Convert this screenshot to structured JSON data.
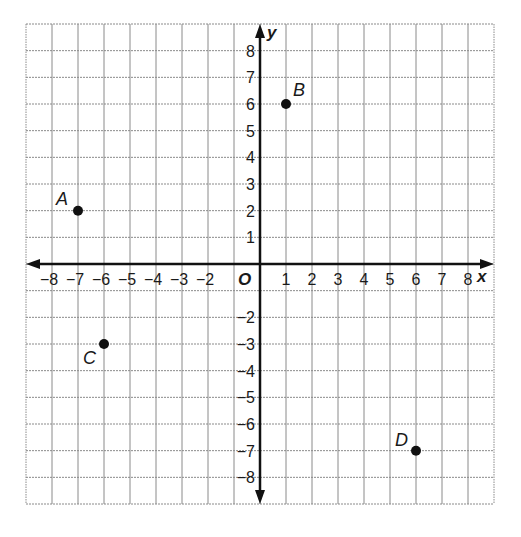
{
  "chart_data": {
    "type": "scatter",
    "title": "",
    "xlabel": "x",
    "ylabel": "y",
    "origin_label": "O",
    "xlim": [
      -9,
      9
    ],
    "ylim": [
      -9,
      9
    ],
    "grid": true,
    "x_ticks": [
      -8,
      -7,
      -6,
      -5,
      -4,
      -3,
      -2,
      1,
      2,
      3,
      4,
      5,
      6,
      7,
      8
    ],
    "x_tick_labels": [
      "−8",
      "−7",
      "−6",
      "−5",
      "−4",
      "−3",
      "−2",
      "1",
      "2",
      "3",
      "4",
      "5",
      "6",
      "7",
      "8"
    ],
    "y_ticks": [
      8,
      7,
      6,
      5,
      4,
      3,
      2,
      1,
      -2,
      -3,
      -4,
      -5,
      -6,
      -7,
      -8
    ],
    "y_tick_labels": [
      "8",
      "7",
      "6",
      "5",
      "4",
      "3",
      "2",
      "1",
      "−2",
      "−3",
      "−4",
      "−5",
      "−6",
      "−7",
      "−8"
    ],
    "points": [
      {
        "label": "A",
        "x": -7,
        "y": 2
      },
      {
        "label": "B",
        "x": 1,
        "y": 6
      },
      {
        "label": "C",
        "x": -6,
        "y": -3
      },
      {
        "label": "D",
        "x": 6,
        "y": -7
      }
    ],
    "legend": null
  },
  "colors": {
    "axis": "#111111",
    "grid": "#8a8a8a",
    "point": "#111111"
  }
}
